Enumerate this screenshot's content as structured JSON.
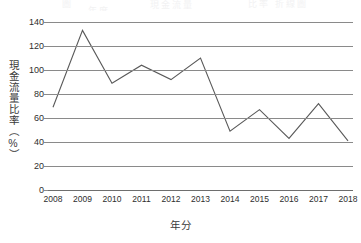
{
  "chart_data": {
    "type": "line",
    "title": "",
    "xlabel": "年分",
    "ylabel": "現金流量比率（%）",
    "categories": [
      "2008",
      "2009",
      "2010",
      "2011",
      "2012",
      "2013",
      "2014",
      "2015",
      "2016",
      "2017",
      "2018"
    ],
    "values": [
      69,
      133,
      89,
      104,
      92,
      110,
      49,
      67,
      43,
      72,
      41
    ],
    "series": [
      {
        "name": "現金流量比率",
        "values": [
          69,
          133,
          89,
          104,
          92,
          110,
          49,
          67,
          43,
          72,
          41
        ]
      }
    ],
    "ylim": [
      0,
      140
    ],
    "ytick_labels": [
      "0",
      "20",
      "40",
      "60",
      "80",
      "100",
      "120",
      "140"
    ],
    "ytick_values": [
      0,
      20,
      40,
      60,
      80,
      100,
      120,
      140
    ],
    "xlim_categories": [
      "2008",
      "2018"
    ],
    "grid": "horizontal",
    "legend": "none",
    "line_color": "#595959",
    "grid_color": "#8a8a8a",
    "background": "#ffffff"
  },
  "axes": {
    "y_title": "現金流量比率（%）",
    "x_title": "年分"
  },
  "top_strip": {
    "frag1": "圖",
    "frag2": "現金流量",
    "frag3": "比率 折線圖",
    "frag4": "年度"
  }
}
